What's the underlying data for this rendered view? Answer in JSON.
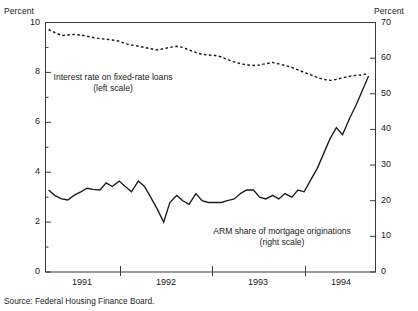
{
  "figure": {
    "source_note": "Source: Federal Housing Finance Board.",
    "left_axis_unit": "Percent",
    "right_axis_unit": "Percent"
  },
  "chart_data": {
    "type": "line",
    "title": "",
    "xlabel": "",
    "grid": false,
    "legend": "annotations-inline",
    "annotations": [
      {
        "name": "fixed-rate-annotation",
        "line1": "Interest rate on fixed-rate loans",
        "line2": "(left scale)",
        "x": 113,
        "y": 78
      },
      {
        "name": "arm-share-annotation",
        "line1": "ARM share of mortgage originations",
        "line2": "(right scale)",
        "x": 282,
        "y": 232
      }
    ],
    "x_axis": {
      "tick_labels": [
        "1991",
        "1992",
        "1993",
        "1994"
      ],
      "tick_label_positions": [
        82,
        166,
        258,
        341
      ],
      "tick_marks": [
        120,
        212,
        305
      ],
      "range": [
        1990.5,
        1994.8
      ]
    },
    "left_axis": {
      "label": "Percent",
      "ylabel": "Percent",
      "ticks": [
        0,
        2,
        4,
        6,
        8,
        10
      ],
      "minor_ticks": [
        1,
        3,
        5,
        7,
        9
      ],
      "ylim": [
        0,
        10
      ]
    },
    "right_axis": {
      "label": "Percent",
      "ylabel": "Percent",
      "ticks": [
        0,
        10,
        20,
        30,
        40,
        50,
        60,
        70
      ],
      "ylim": [
        0,
        70
      ]
    },
    "series": [
      {
        "name": "Interest rate on fixed-rate loans",
        "short_name": "fixed-rate",
        "style": "dashed",
        "axis": "left",
        "units": "percent",
        "x": [
          1990.54,
          1990.62,
          1990.71,
          1990.79,
          1990.87,
          1990.96,
          1991.04,
          1991.12,
          1991.21,
          1991.29,
          1991.37,
          1991.46,
          1991.54,
          1991.62,
          1991.71,
          1991.79,
          1991.87,
          1991.96,
          1992.04,
          1992.12,
          1992.21,
          1992.29,
          1992.37,
          1992.46,
          1992.54,
          1992.62,
          1992.71,
          1992.79,
          1992.87,
          1992.96,
          1993.04,
          1993.12,
          1993.21,
          1993.29,
          1993.37,
          1993.46,
          1993.54,
          1993.62,
          1993.71,
          1993.79,
          1993.87,
          1993.96,
          1994.04,
          1994.12,
          1994.21,
          1994.29,
          1994.37,
          1994.46,
          1994.54,
          1994.62,
          1994.71
        ],
        "values": [
          9.72,
          9.6,
          9.48,
          9.5,
          9.52,
          9.5,
          9.45,
          9.4,
          9.35,
          9.33,
          9.3,
          9.25,
          9.15,
          9.1,
          9.05,
          9.0,
          8.95,
          8.9,
          8.95,
          9.0,
          9.05,
          9.0,
          8.9,
          8.8,
          8.72,
          8.7,
          8.68,
          8.62,
          8.52,
          8.42,
          8.35,
          8.3,
          8.28,
          8.3,
          8.35,
          8.4,
          8.34,
          8.28,
          8.2,
          8.1,
          8.0,
          7.9,
          7.8,
          7.72,
          7.68,
          7.72,
          7.78,
          7.84,
          7.88,
          7.9,
          7.95
        ]
      },
      {
        "name": "ARM share of mortgage originations",
        "short_name": "arm-share",
        "style": "solid",
        "axis": "right",
        "units": "percent",
        "x": [
          1990.54,
          1990.62,
          1990.71,
          1990.79,
          1990.87,
          1990.96,
          1991.04,
          1991.12,
          1991.21,
          1991.29,
          1991.37,
          1991.46,
          1991.54,
          1991.62,
          1991.71,
          1991.79,
          1991.87,
          1991.96,
          1992.04,
          1992.12,
          1992.21,
          1992.29,
          1992.37,
          1992.46,
          1992.54,
          1992.62,
          1992.71,
          1992.79,
          1992.87,
          1992.96,
          1993.04,
          1993.12,
          1993.21,
          1993.29,
          1993.37,
          1993.46,
          1993.54,
          1993.62,
          1993.71,
          1993.79,
          1993.87,
          1993.96,
          1994.04,
          1994.12,
          1994.21,
          1994.29,
          1994.37,
          1994.46,
          1994.54,
          1994.62,
          1994.71
        ],
        "values": [
          23.0,
          21.5,
          20.5,
          20.2,
          21.5,
          22.5,
          23.5,
          23.2,
          23.0,
          25.0,
          24.0,
          25.5,
          24.0,
          22.5,
          25.5,
          24.0,
          21.0,
          17.5,
          14.0,
          19.5,
          21.5,
          20.0,
          19.0,
          22.0,
          20.0,
          19.5,
          19.5,
          19.5,
          20.0,
          20.5,
          22.0,
          23.0,
          23.0,
          21.0,
          20.5,
          21.5,
          20.5,
          22.0,
          21.0,
          23.0,
          22.5,
          26.0,
          29.0,
          33.0,
          37.5,
          40.5,
          38.5,
          43.0,
          46.5,
          50.5,
          55.0
        ]
      }
    ]
  }
}
